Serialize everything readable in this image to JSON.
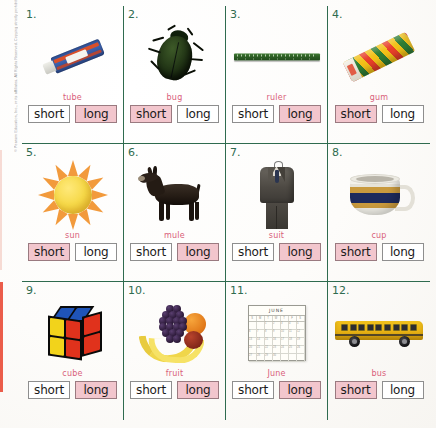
{
  "worksheet": {
    "title": "Short and Long Vowel Sounds Worksheet",
    "copyright": "© Pearson Education, Inc., or its affiliates. All Rights Reserved. Copying strictly prohibited.",
    "choice_labels": {
      "short": "short",
      "long": "long"
    },
    "colors": {
      "grid_line": "#2f6b4f",
      "number": "#2f6b4f",
      "word_label": "#d9607a",
      "selected_fill": "#f2c6cd",
      "box_border": "#8e8e8e",
      "page_background": "#fdfcfa",
      "edge_stripe": "#e8412c"
    },
    "calendar": {
      "month": "JUNE",
      "weekday_initials": [
        "S",
        "M",
        "T",
        "W",
        "T",
        "F",
        "S"
      ],
      "day_numbers": [
        "",
        "",
        "1",
        "2",
        "3",
        "4",
        "5",
        "6",
        "7",
        "8",
        "9",
        "10",
        "11",
        "12",
        "13",
        "14",
        "15",
        "16",
        "17",
        "18",
        "19",
        "20",
        "21",
        "22",
        "23",
        "24",
        "25",
        "26",
        "27",
        "28",
        "29",
        "30",
        "",
        "",
        ""
      ]
    },
    "items": [
      {
        "number": "1.",
        "word": "tube",
        "icon": "toothpaste-tube-image",
        "answer": "long",
        "short_selected": false,
        "long_selected": true
      },
      {
        "number": "2.",
        "word": "bug",
        "icon": "beetle-bug-image",
        "answer": "short",
        "short_selected": true,
        "long_selected": false
      },
      {
        "number": "3.",
        "word": "ruler",
        "icon": "ruler-image",
        "answer": "long",
        "short_selected": false,
        "long_selected": true
      },
      {
        "number": "4.",
        "word": "gum",
        "icon": "gum-stick-image",
        "answer": "short",
        "short_selected": true,
        "long_selected": false
      },
      {
        "number": "5.",
        "word": "sun",
        "icon": "sun-image",
        "answer": "short",
        "short_selected": true,
        "long_selected": false
      },
      {
        "number": "6.",
        "word": "mule",
        "icon": "mule-image",
        "answer": "long",
        "short_selected": false,
        "long_selected": true
      },
      {
        "number": "7.",
        "word": "suit",
        "icon": "suit-image",
        "answer": "long",
        "short_selected": false,
        "long_selected": true
      },
      {
        "number": "8.",
        "word": "cup",
        "icon": "cup-image",
        "answer": "short",
        "short_selected": true,
        "long_selected": false
      },
      {
        "number": "9.",
        "word": "cube",
        "icon": "rubiks-cube-image",
        "answer": "long",
        "short_selected": false,
        "long_selected": true
      },
      {
        "number": "10.",
        "word": "fruit",
        "icon": "fruit-bowl-image",
        "answer": "long",
        "short_selected": false,
        "long_selected": true
      },
      {
        "number": "11.",
        "word": "June",
        "icon": "calendar-image",
        "answer": "long",
        "short_selected": false,
        "long_selected": true
      },
      {
        "number": "12.",
        "word": "bus",
        "icon": "school-bus-image",
        "answer": "short",
        "short_selected": true,
        "long_selected": false
      }
    ]
  }
}
